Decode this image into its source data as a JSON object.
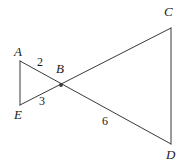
{
  "figure": {
    "type": "geometry-diagram",
    "background_color": "#ffffff",
    "stroke_color": "#3a3a3a",
    "text_color": "#1a1a1a",
    "stroke_width": 1,
    "width": 185,
    "height": 166
  },
  "points": [
    {
      "name": "A",
      "label": "A",
      "x": 20,
      "y": 61,
      "label_x": 14,
      "label_y": 45
    },
    {
      "name": "B",
      "label": "B",
      "x": 61,
      "y": 85,
      "label_x": 56,
      "label_y": 62,
      "marker": true
    },
    {
      "name": "C",
      "label": "C",
      "x": 171,
      "y": 28,
      "label_x": 164,
      "label_y": 5
    },
    {
      "name": "D",
      "label": "D",
      "x": 171,
      "y": 144,
      "label_x": 166,
      "label_y": 148
    },
    {
      "name": "E",
      "label": "E",
      "x": 20,
      "y": 105,
      "label_x": 14,
      "label_y": 108
    }
  ],
  "segments": [
    {
      "name": "segment-AE",
      "from": "A",
      "to": "E",
      "x1": 20,
      "y1": 61,
      "x2": 20,
      "y2": 105
    },
    {
      "name": "segment-CD",
      "from": "C",
      "to": "D",
      "x1": 171,
      "y1": 28,
      "x2": 171,
      "y2": 144
    },
    {
      "name": "segment-AD",
      "from": "A",
      "to": "D",
      "x1": 20,
      "y1": 61,
      "x2": 171,
      "y2": 144
    },
    {
      "name": "segment-EC",
      "from": "E",
      "to": "C",
      "x1": 20,
      "y1": 105,
      "x2": 171,
      "y2": 28
    }
  ],
  "angle_labels": [
    {
      "name": "angle-2",
      "text": "2",
      "x": 37,
      "y": 56
    },
    {
      "name": "angle-3",
      "text": "3",
      "x": 39,
      "y": 95
    },
    {
      "name": "angle-6",
      "text": "6",
      "x": 102,
      "y": 115
    }
  ]
}
